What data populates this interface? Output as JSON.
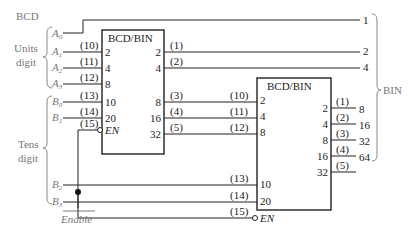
{
  "labels": {
    "bcd": "BCD",
    "units_digit_1": "Units",
    "units_digit_2": "digit",
    "tens_digit_1": "Tens",
    "tens_digit_2": "digit",
    "bin": "BIN",
    "enable": "Enable"
  },
  "inputs": {
    "A": [
      "A",
      "0",
      "A",
      "1",
      "A",
      "2",
      "A",
      "3"
    ],
    "B": [
      "B",
      "0",
      "B",
      "1",
      "B",
      "2",
      "B",
      "3"
    ]
  },
  "chip1": {
    "title": "BCD/BIN",
    "in_pins": [
      "2",
      "4",
      "8",
      "10",
      "20"
    ],
    "en_pin": "EN",
    "out_pins": [
      "2",
      "4",
      "8",
      "16",
      "32"
    ],
    "in_pin_numbers": [
      "(10)",
      "(11)",
      "(12)",
      "(13)",
      "(14)",
      "(15)"
    ],
    "out_pin_numbers": [
      "(1)",
      "(2)",
      "(3)",
      "(4)",
      "(5)"
    ]
  },
  "chip2": {
    "title": "BCD/BIN",
    "in_pins": [
      "2",
      "4",
      "8",
      "10",
      "20"
    ],
    "en_pin": "EN",
    "out_pins": [
      "2",
      "4",
      "8",
      "16",
      "32"
    ],
    "in_pin_numbers": [
      "(10)",
      "(11)",
      "(12)",
      "(13)",
      "(14)",
      "(15)"
    ],
    "out_pin_numbers": [
      "(1)",
      "(2)",
      "(3)",
      "(4)",
      "(5)"
    ]
  },
  "outputs": [
    "1",
    "2",
    "4",
    "8",
    "16",
    "32",
    "64"
  ]
}
